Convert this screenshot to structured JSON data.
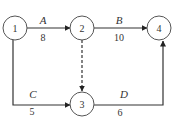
{
  "diagram": {
    "type": "activity-on-arrow network",
    "nodes": [
      {
        "id": "1",
        "label": "1"
      },
      {
        "id": "2",
        "label": "2"
      },
      {
        "id": "3",
        "label": "3"
      },
      {
        "id": "4",
        "label": "4"
      }
    ],
    "edges": [
      {
        "from": "1",
        "to": "2",
        "activity": "A",
        "duration": "8",
        "style": "solid"
      },
      {
        "from": "2",
        "to": "4",
        "activity": "B",
        "duration": "10",
        "style": "solid"
      },
      {
        "from": "1",
        "to": "3",
        "activity": "C",
        "duration": "5",
        "style": "solid"
      },
      {
        "from": "3",
        "to": "4",
        "activity": "D",
        "duration": "6",
        "style": "solid"
      },
      {
        "from": "2",
        "to": "3",
        "activity": "",
        "duration": "",
        "style": "dashed"
      }
    ]
  }
}
